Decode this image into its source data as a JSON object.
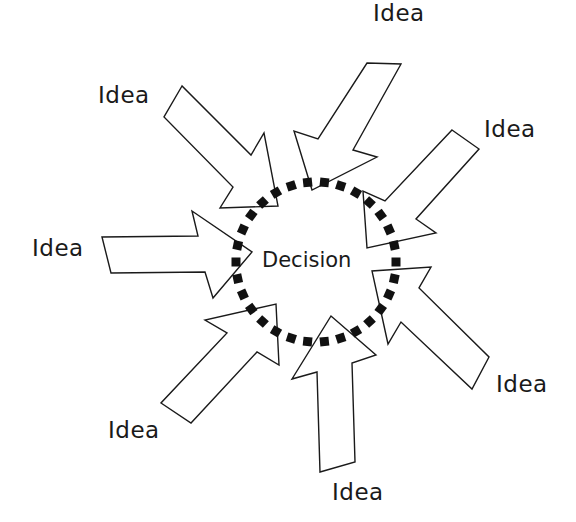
{
  "diagram": {
    "center": {
      "label": "Decision",
      "cx": 316,
      "cy": 262,
      "ring_radius": 80,
      "ring_style": "dotted-square"
    },
    "arrows": [
      {
        "id": "top-left",
        "label": "Idea",
        "points": "182,86 164,117 233,187 220,208 278,206 264,133 251,155"
      },
      {
        "id": "top",
        "label": "Idea",
        "points": "367,63 401,64 353,150 377,157 312,190 294,131 318,139"
      },
      {
        "id": "top-right",
        "label": "Idea",
        "points": "452,130 479,149 416,219 436,233 367,248 363,191 385,201"
      },
      {
        "id": "left",
        "label": "Idea",
        "points": "102,237 111,273 205,272 213,298 252,252 192,211 198,236"
      },
      {
        "id": "bottom-right",
        "label": "Idea",
        "points": "489,357 472,389 401,322 388,344 372,271 431,267 419,288"
      },
      {
        "id": "bottom-left",
        "label": "Idea",
        "points": "161,403 191,423 257,352 279,365 276,304 205,320 227,333"
      },
      {
        "id": "bottom",
        "label": "Idea",
        "points": "320,472 355,462 352,363 376,355 331,316 292,379 317,372"
      }
    ],
    "labels": [
      {
        "text": "Idea",
        "x": 373,
        "y": 2
      },
      {
        "text": "Idea",
        "x": 98,
        "y": 84
      },
      {
        "text": "Idea",
        "x": 484,
        "y": 118
      },
      {
        "text": "Idea",
        "x": 32,
        "y": 237
      },
      {
        "text": "Idea",
        "x": 496,
        "y": 373
      },
      {
        "text": "Idea",
        "x": 108,
        "y": 419
      },
      {
        "text": "Idea",
        "x": 332,
        "y": 481
      }
    ]
  }
}
